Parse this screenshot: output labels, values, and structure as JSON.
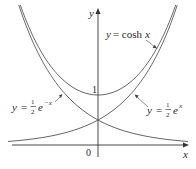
{
  "chart_data": {
    "type": "line",
    "title": "",
    "xlabel": "x",
    "ylabel": "y",
    "xlim": [
      -2.1,
      2.1
    ],
    "ylim": [
      -0.5,
      2.9
    ],
    "grid": false,
    "legend": "inline annotations with arrows",
    "annotations": [
      {
        "text": "y = cosh x",
        "target": "cosh"
      },
      {
        "text": "y = ½e^(−x)",
        "target": "half_exp_neg"
      },
      {
        "text": "y = ½e^(x)",
        "target": "half_exp_pos"
      }
    ],
    "tick_labels": {
      "x": [
        "0"
      ],
      "y": [
        "1"
      ]
    },
    "series": [
      {
        "name": "y = cosh x",
        "formula": "cosh(x)",
        "x": [
          -1.7,
          -1.5,
          -1,
          -0.5,
          0,
          0.5,
          1,
          1.5,
          1.7
        ],
        "values": [
          2.83,
          2.35,
          1.54,
          1.13,
          1.0,
          1.13,
          1.54,
          2.35,
          2.83
        ]
      },
      {
        "name": "y = ½e^(−x)",
        "formula": "0.5*exp(-x)",
        "x": [
          -1.7,
          -1.5,
          -1,
          -0.5,
          0,
          0.5,
          1,
          1.5,
          2
        ],
        "values": [
          2.74,
          2.24,
          1.36,
          0.82,
          0.5,
          0.3,
          0.18,
          0.11,
          0.07
        ]
      },
      {
        "name": "y = ½e^(x)",
        "formula": "0.5*exp(x)",
        "x": [
          -2,
          -1.5,
          -1,
          -0.5,
          0,
          0.5,
          1,
          1.5,
          1.7
        ],
        "values": [
          0.07,
          0.11,
          0.18,
          0.3,
          0.5,
          0.82,
          1.36,
          2.24,
          2.74
        ]
      }
    ]
  },
  "labels": {
    "y_axis": "y",
    "x_axis": "x",
    "origin": "0",
    "one": "1",
    "cosh_y": "y",
    "cosh_eq": "= cosh",
    "cosh_x": "x",
    "neg_y": "y",
    "neg_eq": "=",
    "neg_num": "1",
    "neg_den": "2",
    "neg_e": "e",
    "neg_exp": "−x",
    "pos_y": "y",
    "pos_eq": "=",
    "pos_num": "1",
    "pos_den": "2",
    "pos_e": "e",
    "pos_exp": "x"
  },
  "colors": {
    "curve": "#555555",
    "axis": "#333333",
    "text": "#2a2a2a"
  }
}
